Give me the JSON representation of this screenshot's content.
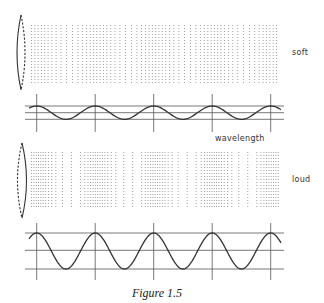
{
  "figure": {
    "caption": "Figure 1.5",
    "annotation_wavelength": "wavelength",
    "panels": [
      {
        "id": "soft",
        "label": "soft",
        "amplitude": 0.35,
        "cycles": 4,
        "speaker_dashed_side": "right",
        "description": "low-amplitude sound wave with weak compressions and rarefactions"
      },
      {
        "id": "loud",
        "label": "loud",
        "amplitude": 1.0,
        "cycles": 4,
        "speaker_dashed_side": "left",
        "description": "high-amplitude sound wave with strong compressions and rarefactions"
      }
    ],
    "colors": {
      "ink": "#333333",
      "dots": "#8a8a8a",
      "background": "#ffffff"
    }
  }
}
